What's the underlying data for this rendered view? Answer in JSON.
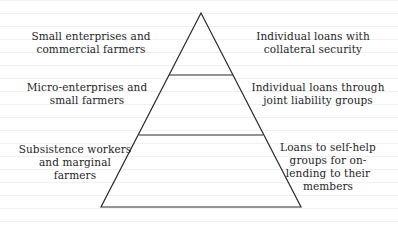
{
  "diagram": {
    "type": "pyramid",
    "levels": [
      {
        "position": "top",
        "client_label_lines": [
          "Small enterprises and",
          "commercial farmers"
        ],
        "loan_label_lines": [
          "Individual loans with",
          "collateral security"
        ]
      },
      {
        "position": "middle",
        "client_label_lines": [
          "Micro-enterprises and",
          "small farmers"
        ],
        "loan_label_lines": [
          "Individual loans through",
          "joint liability groups"
        ]
      },
      {
        "position": "bottom",
        "client_label_lines": [
          "Subsistence workers",
          "and marginal",
          "farmers"
        ],
        "loan_label_lines": [
          "Loans to self-help",
          "groups for on-",
          "lending to their",
          "members"
        ]
      }
    ],
    "colors": {
      "line": "#2a2a2a",
      "text": "#1e1e1e",
      "background": "#ffffff"
    }
  }
}
